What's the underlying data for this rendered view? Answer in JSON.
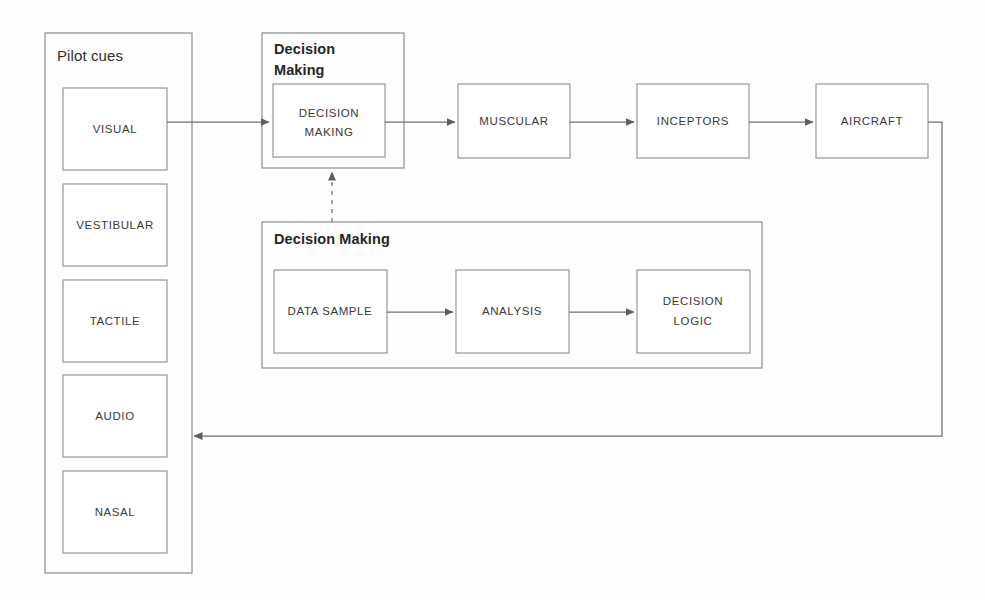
{
  "diagram": {
    "title_visible": false,
    "colors": {
      "background": "#fefefe",
      "box_stroke": "#8d8d8d",
      "group_stroke": "#8d8d8d",
      "connector": "#6f6f6f",
      "box_fill": "#ffffff",
      "label_text": "#3a3a3a",
      "group_text": "#262626"
    },
    "pilot_cues": {
      "label": "Pilot cues",
      "items": [
        {
          "label": "VISUAL"
        },
        {
          "label": "VESTIBULAR"
        },
        {
          "label": "TACTILE"
        },
        {
          "label": "AUDIO"
        },
        {
          "label": "NASAL"
        }
      ]
    },
    "decision_group_top": {
      "label": "Decision Making",
      "label_line1": "Decision",
      "label_line2": "Making",
      "inner_box": {
        "label": "DECISION MAKING",
        "line1": "DECISION",
        "line2": "MAKING"
      }
    },
    "process_chain": [
      {
        "label": "MUSCULAR"
      },
      {
        "label": "INCEPTORS"
      },
      {
        "label": "AIRCRAFT"
      }
    ],
    "decision_group_bottom": {
      "label": "Decision Making",
      "items": [
        {
          "label": "DATA SAMPLE",
          "line1": "DATA SAMPLE",
          "line2": ""
        },
        {
          "label": "ANALYSIS",
          "line1": "ANALYSIS",
          "line2": ""
        },
        {
          "label": "DECISION LOGIC",
          "line1": "DECISION",
          "line2": "LOGIC"
        }
      ]
    },
    "connectors": [
      {
        "name": "visual-to-decision",
        "style": "solid",
        "arrow": "right"
      },
      {
        "name": "decision-to-muscular",
        "style": "solid",
        "arrow": "right"
      },
      {
        "name": "muscular-to-inceptors",
        "style": "solid",
        "arrow": "right"
      },
      {
        "name": "inceptors-to-aircraft",
        "style": "solid",
        "arrow": "right"
      },
      {
        "name": "aircraft-feedback-to-audio",
        "style": "solid",
        "arrow": "left"
      },
      {
        "name": "decision-making-detail-link",
        "style": "dashed",
        "arrow": "up"
      },
      {
        "name": "data-sample-to-analysis",
        "style": "solid",
        "arrow": "right"
      },
      {
        "name": "analysis-to-decision-logic",
        "style": "solid",
        "arrow": "right"
      }
    ]
  }
}
